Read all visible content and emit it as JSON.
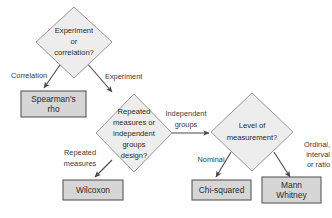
{
  "diagram": {
    "colors": {
      "background": "#ffffff",
      "diamond_fill": "#ededed",
      "diamond_stroke": "#8c8c8c",
      "box_fill": "#d6d6d6",
      "box_stroke": "#5a5a5a",
      "connector": "#4a4a4a",
      "text": "#2b2b2b",
      "label_text": "#3a3a3a"
    },
    "decisions": [
      {
        "id": "experiment-or-correlation",
        "lines": [
          "Experiment",
          "or",
          "correlation?"
        ]
      },
      {
        "id": "repeated-or-independent",
        "lines": [
          "Repeated",
          "measures or",
          "independent",
          "groups",
          "design?"
        ]
      },
      {
        "id": "level-of-measurement",
        "lines": [
          "Level of",
          "measurement?"
        ]
      }
    ],
    "results": [
      {
        "id": "spearmans-rho",
        "lines": [
          "Spearman's",
          "rho"
        ]
      },
      {
        "id": "wilcoxon",
        "lines": [
          "Wilcoxon"
        ]
      },
      {
        "id": "chi-squared",
        "lines": [
          "Chi-squared"
        ]
      },
      {
        "id": "mann-whitney",
        "lines": [
          "Mann",
          "Whitney"
        ]
      }
    ],
    "edge_labels": [
      {
        "id": "correlation",
        "lines": [
          "Correlation"
        ]
      },
      {
        "id": "experiment",
        "lines": [
          "Experiment"
        ]
      },
      {
        "id": "independent-groups",
        "lines": [
          "Independent",
          "groups"
        ]
      },
      {
        "id": "repeated-measures",
        "lines": [
          "Repeated",
          "measures"
        ]
      },
      {
        "id": "nominal",
        "lines": [
          "Nominal"
        ]
      },
      {
        "id": "ordinal-interval-ratio",
        "lines": [
          "Ordinal,",
          "interval",
          "or ratio"
        ]
      }
    ]
  }
}
